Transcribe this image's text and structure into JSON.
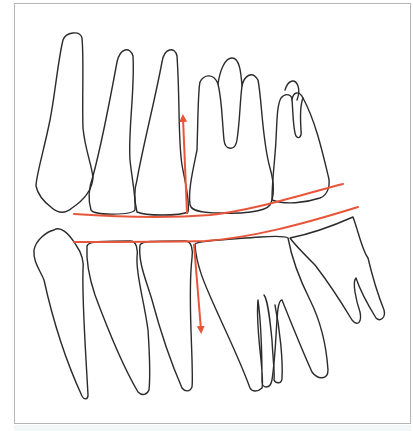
{
  "diagram": {
    "title": "",
    "colors": {
      "tooth_outline": "#2b2b2b",
      "occlusal_line": "#e8553a",
      "arrow": "#e8553a",
      "frame_border": "#b5b5b5",
      "background": "#ffffff"
    },
    "upper_teeth": [
      {
        "name": "upper-canine"
      },
      {
        "name": "upper-first-premolar"
      },
      {
        "name": "upper-second-premolar"
      },
      {
        "name": "upper-first-molar"
      },
      {
        "name": "upper-second-molar"
      }
    ],
    "lower_teeth": [
      {
        "name": "lower-canine"
      },
      {
        "name": "lower-first-premolar"
      },
      {
        "name": "lower-second-premolar"
      },
      {
        "name": "lower-first-molar"
      },
      {
        "name": "lower-second-molar"
      }
    ],
    "annotations": [
      {
        "type": "occlusal-curve",
        "arch": "upper"
      },
      {
        "type": "occlusal-curve",
        "arch": "lower"
      },
      {
        "type": "arrow",
        "direction": "up"
      },
      {
        "type": "arrow",
        "direction": "down"
      }
    ]
  }
}
